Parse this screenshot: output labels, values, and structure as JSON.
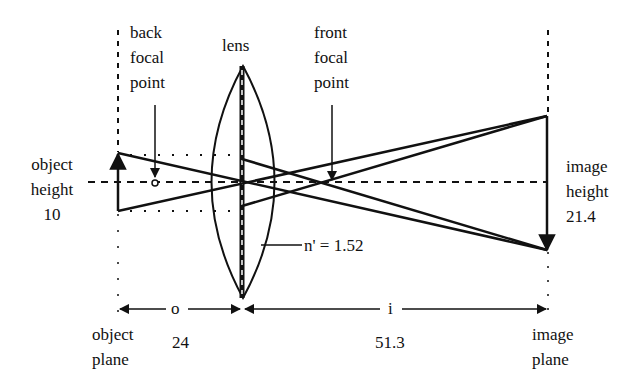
{
  "labels": {
    "back_focal_point": [
      "back",
      "focal",
      "point"
    ],
    "lens": "lens",
    "front_focal_point": [
      "front",
      "focal",
      "point"
    ],
    "object_height": [
      "object",
      "height",
      "10"
    ],
    "image_height": [
      "image",
      "height",
      "21.4"
    ],
    "refractive_index": "n' = 1.52",
    "object_distance_symbol": "o",
    "image_distance_symbol": "i",
    "object_distance_value": "24",
    "image_distance_value": "51.3",
    "object_plane": [
      "object",
      "plane"
    ],
    "image_plane": [
      "image",
      "plane"
    ]
  },
  "values": {
    "object_height": 10,
    "image_height": 21.4,
    "object_distance": 24,
    "image_distance": 51.3,
    "refractive_index": 1.52
  },
  "colors": {
    "ink": "#111111",
    "background": "#ffffff"
  }
}
